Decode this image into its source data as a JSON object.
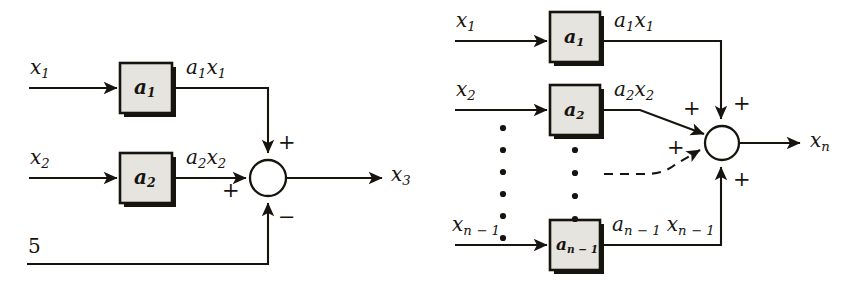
{
  "figure": {
    "background_color": "#ffffff",
    "ink_color": "#17140f",
    "block_fill_color": "#e6e4df"
  },
  "diagrams": [
    {
      "id": "left",
      "name": "three-input-summer",
      "blocks": [
        {
          "label_main": "a",
          "label_sub": "1"
        },
        {
          "label_main": "a",
          "label_sub": "2"
        }
      ],
      "inputs": [
        {
          "main": "x",
          "sub": "1"
        },
        {
          "main": "x",
          "sub": "2"
        }
      ],
      "constant_input": "5",
      "signals": [
        {
          "text": "a",
          "sub1": "1",
          "text2": "x",
          "sub2": "1"
        },
        {
          "text": "a",
          "sub1": "2",
          "text2": "x",
          "sub2": "2"
        }
      ],
      "signs": [
        "+",
        "+",
        "−"
      ],
      "output": {
        "main": "x",
        "sub": "3"
      }
    },
    {
      "id": "right",
      "name": "n-input-summer",
      "blocks": [
        {
          "label_main": "a",
          "label_sub": "1"
        },
        {
          "label_main": "a",
          "label_sub": "2"
        },
        {
          "label_main": "a",
          "label_sub": "n − 1"
        }
      ],
      "inputs": [
        {
          "main": "x",
          "sub": "1"
        },
        {
          "main": "x",
          "sub": "2"
        },
        {
          "main": "x",
          "sub": "n − 1"
        }
      ],
      "signals": [
        {
          "text": "a",
          "sub1": "1",
          "text2": "x",
          "sub2": "1"
        },
        {
          "text": "a",
          "sub1": "2",
          "text2": "x",
          "sub2": "2"
        },
        {
          "text": "a",
          "sub1": "n − 1",
          "text2": "x",
          "sub2": "n − 1"
        }
      ],
      "signs": [
        "+",
        "+",
        "+",
        "+"
      ],
      "ellipsis_dot_counts": [
        6,
        4
      ],
      "output": {
        "main": "x",
        "sub": "n"
      }
    }
  ],
  "left": {
    "input1_main": "x",
    "input1_sub": "1",
    "input2_main": "x",
    "input2_sub": "2",
    "const_label": "5",
    "block1_main": "a",
    "block1_sub": "1",
    "block2_main": "a",
    "block2_sub": "2",
    "sig1_a": "a",
    "sig1_asub": "1",
    "sig1_x": "x",
    "sig1_xsub": "1",
    "sig2_a": "a",
    "sig2_asub": "2",
    "sig2_x": "x",
    "sig2_xsub": "2",
    "sign_top": "+",
    "sign_left": "+",
    "sign_bottom": "−",
    "out_main": "x",
    "out_sub": "3"
  },
  "right": {
    "input1_main": "x",
    "input1_sub": "1",
    "input2_main": "x",
    "input2_sub": "2",
    "input3_main": "x",
    "input3_sub": "n − 1",
    "block1_main": "a",
    "block1_sub": "1",
    "block2_main": "a",
    "block2_sub": "2",
    "block3_main": "a",
    "block3_sub": "n − 1",
    "sig1_a": "a",
    "sig1_asub": "1",
    "sig1_x": "x",
    "sig1_xsub": "1",
    "sig2_a": "a",
    "sig2_asub": "2",
    "sig2_x": "x",
    "sig2_xsub": "2",
    "sig3_a": "a",
    "sig3_asub": "n − 1",
    "sig3_x": "x",
    "sig3_xsub": "n − 1",
    "sign_top_right": "+",
    "sign_top_inner": "+",
    "sign_mid": "+",
    "sign_bottom": "+",
    "out_main": "x",
    "out_sub": "n"
  }
}
